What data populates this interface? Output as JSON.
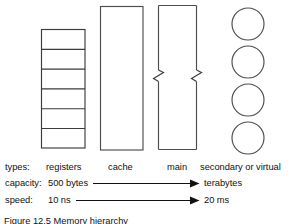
{
  "figure": {
    "caption": "Figure 12.5  Memory hierarchy"
  },
  "diagram": {
    "stroke_color": "#4d4d4d",
    "text_color": "#111111",
    "background": "#ffffff",
    "registers": {
      "name": "registers-box",
      "cell_count": 6,
      "x": 41,
      "y": 29,
      "width": 44,
      "height": 119
    },
    "cache": {
      "name": "cache-box",
      "x": 100,
      "y": 6,
      "width": 43,
      "height": 144
    },
    "main_memory": {
      "name": "main-memory-box",
      "x": 158,
      "y": 5,
      "width": 38,
      "height": 145,
      "break_marks": 2,
      "break_mark_y": 76
    },
    "secondary": {
      "name": "secondary-storage-platters",
      "circle_count": 4,
      "cx": 248,
      "radius": 16,
      "cy_values": [
        24,
        62,
        100,
        138
      ]
    }
  },
  "legend": {
    "rows": [
      {
        "key": "types",
        "label": "types:",
        "values": [
          "registers",
          "cache",
          "main",
          "secondary or virtual"
        ]
      },
      {
        "key": "capacity",
        "label": "capacity:",
        "start_value": "500 bytes",
        "end_value": "terabytes",
        "arrow": "right-arrow"
      },
      {
        "key": "speed",
        "label": "speed:",
        "start_value": "10 ns",
        "end_value": "20 ms",
        "arrow": "right-arrow"
      }
    ]
  }
}
